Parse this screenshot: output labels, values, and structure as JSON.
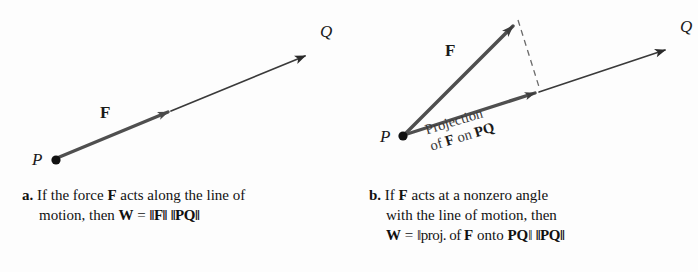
{
  "figure": {
    "kind": "vector-work-diagram",
    "background": "#fdfdfd",
    "ink": "#1a1a1a",
    "vector_gray": "#4f4f4f",
    "dash_gray": "#6b6b6b"
  },
  "panel_a": {
    "point_p_label": "P",
    "point_q_label": "Q",
    "force_label": "F",
    "caption": {
      "tag": "a.",
      "line1_pre": " If the force ",
      "line1_bold": "F",
      "line1_post": " acts along the line of",
      "line2_pre": "motion, then ",
      "line2_w": "W",
      "line2_eq": " = ",
      "line2_normF": "‖F‖",
      "line2_space": " ",
      "line2_normPQ": "‖PQ‖"
    }
  },
  "panel_b": {
    "point_p_label": "P",
    "point_q_label": "Q",
    "force_label": "F",
    "projection_note_line1": "Projection",
    "projection_note_line2_pre": "of ",
    "projection_note_line2_f": "F",
    "projection_note_line2_mid": " on ",
    "projection_note_line2_pq": "PQ",
    "caption": {
      "tag": "b.",
      "line1_pre": " If ",
      "line1_bold": "F",
      "line1_post": " acts at a nonzero angle",
      "line2": "with the line of motion, then",
      "line3_w": "W",
      "line3_eq": " = ",
      "line3_norm_open": "‖proj. of ",
      "line3_f": "F",
      "line3_onto": " onto ",
      "line3_pq": "PQ",
      "line3_norm_close": "‖",
      "line3_space": " ",
      "line3_normPQ": "‖PQ‖"
    }
  }
}
